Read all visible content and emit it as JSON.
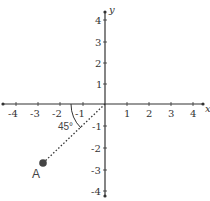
{
  "diagram": {
    "axes": {
      "x_label": "x",
      "y_label": "y",
      "x_ticks": [
        "-4",
        "-3",
        "-2",
        "-1",
        "1",
        "2",
        "3",
        "4"
      ],
      "y_ticks": [
        "4",
        "3",
        "2",
        "1",
        "-1",
        "-2",
        "-3",
        "-4"
      ]
    },
    "angle_label": "45°",
    "point_label": "A",
    "colors": {
      "axis": "#333333",
      "point": "#444444",
      "text": "#333333"
    }
  }
}
